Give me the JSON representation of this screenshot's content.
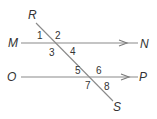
{
  "diagram": {
    "type": "parallel lines cut by a transversal",
    "colors": {
      "line": "#8a8a8a",
      "text": "#333333",
      "background": "#ffffff"
    },
    "lines": [
      {
        "id": "MN",
        "start_label": "M",
        "end_label": "N",
        "arrow": "toward N",
        "role": "parallel line"
      },
      {
        "id": "OP",
        "start_label": "O",
        "end_label": "P",
        "arrow": "toward P",
        "role": "parallel line"
      },
      {
        "id": "RS",
        "start_label": "R",
        "end_label": "S",
        "role": "transversal"
      }
    ],
    "points": {
      "R": "R",
      "S": "S",
      "M": "M",
      "N": "N",
      "O": "O",
      "P": "P"
    },
    "angles": {
      "a1": "1",
      "a2": "2",
      "a3": "3",
      "a4": "4",
      "a5": "5",
      "a6": "6",
      "a7": "7",
      "a8": "8"
    },
    "intersections": [
      {
        "lines": [
          "MN",
          "RS"
        ],
        "angles": [
          "1",
          "2",
          "3",
          "4"
        ]
      },
      {
        "lines": [
          "OP",
          "RS"
        ],
        "angles": [
          "5",
          "6",
          "7",
          "8"
        ]
      }
    ]
  }
}
